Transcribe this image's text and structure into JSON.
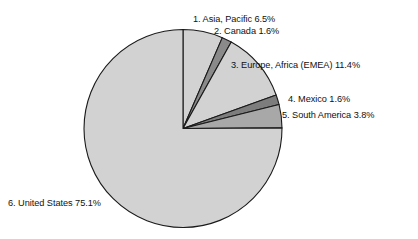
{
  "chart_data": {
    "type": "pie",
    "title": "",
    "xlabel": "",
    "ylabel": "",
    "legend_position": "none",
    "grid": false,
    "start_angle_deg": 0,
    "direction": "clockwise",
    "units": "percent",
    "total": 100.0,
    "categories": [
      "Asia, Pacific",
      "Canada",
      "Europe, Africa (EMEA)",
      "Mexico",
      "South America",
      "United States"
    ],
    "values": [
      6.5,
      1.6,
      11.4,
      1.6,
      3.8,
      75.1
    ],
    "slices": [
      {
        "index": "1",
        "name": "Asia, Pacific",
        "value": 6.5,
        "value_text": "6.5%",
        "label": "1. Asia, Pacific 6.5%",
        "color": "#d2d2d2"
      },
      {
        "index": "2",
        "name": "Canada",
        "value": 1.6,
        "value_text": "1.6%",
        "label": "2. Canada 1.6%",
        "color": "#8a8a8a"
      },
      {
        "index": "3",
        "name": "Europe, Africa (EMEA)",
        "value": 11.4,
        "value_text": "11.4%",
        "label": "3. Europe, Africa (EMEA) 11.4%",
        "color": "#d2d2d2"
      },
      {
        "index": "4",
        "name": "Mexico",
        "value": 1.6,
        "value_text": "1.6%",
        "label": "4. Mexico 1.6%",
        "color": "#7d7d7d"
      },
      {
        "index": "5",
        "name": "South America",
        "value": 3.8,
        "value_text": "3.8%",
        "label": "5. South America 3.8%",
        "color": "#a8a8a8"
      },
      {
        "index": "6",
        "name": "United States",
        "value": 75.1,
        "value_text": "75.1%",
        "label": "6. United States 75.1%",
        "color": "#d2d2d2"
      }
    ],
    "geometry": {
      "cx": 183,
      "cy": 128.5,
      "r": 99
    },
    "style": {
      "background": "#ffffff",
      "outline": "#1a1a1a",
      "text": "#111111"
    }
  }
}
